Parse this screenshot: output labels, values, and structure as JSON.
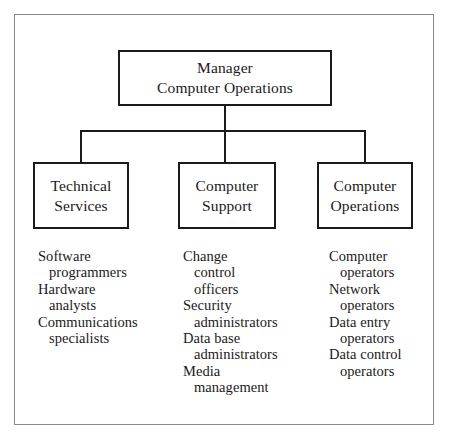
{
  "chart_data": {
    "type": "diagram",
    "root": {
      "title_lines": [
        "Manager",
        "Computer Operations"
      ]
    },
    "branches": [
      {
        "box_lines": [
          "Technical",
          "Services"
        ],
        "roles": [
          {
            "lines": [
              "Software",
              "programmers"
            ]
          },
          {
            "lines": [
              "Hardware",
              "analysts"
            ]
          },
          {
            "lines": [
              "Communications",
              "specialists"
            ]
          }
        ]
      },
      {
        "box_lines": [
          "Computer",
          "Support"
        ],
        "roles": [
          {
            "lines": [
              "Change",
              "control",
              "officers"
            ]
          },
          {
            "lines": [
              "Security",
              "administrators"
            ]
          },
          {
            "lines": [
              "Data base",
              "administrators"
            ]
          },
          {
            "lines": [
              "Media",
              "management"
            ]
          }
        ]
      },
      {
        "box_lines": [
          "Computer",
          "Operations"
        ],
        "roles": [
          {
            "lines": [
              "Computer",
              "operators"
            ]
          },
          {
            "lines": [
              "Network",
              "operators"
            ]
          },
          {
            "lines": [
              "Data entry",
              "operators"
            ]
          },
          {
            "lines": [
              "Data control",
              "operators"
            ]
          }
        ]
      }
    ],
    "colors": {
      "box_border": "#1a1a1a",
      "frame_border": "#8a8a8a",
      "text": "#1a1a1a",
      "background": "#ffffff"
    }
  }
}
